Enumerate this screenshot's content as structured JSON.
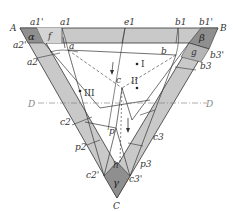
{
  "diagram": {
    "colors": {
      "band": "#c9c9c9",
      "corner": "#8f8f8f",
      "edge_shade": "#b5b5b5",
      "line": "#333333",
      "background": "#ffffff"
    },
    "vertices": {
      "A": "A",
      "B": "B",
      "C": "C"
    },
    "corner_regions": {
      "alpha": "α",
      "beta": "β",
      "gamma": "γ"
    },
    "two_phase_regions": {
      "f": "f",
      "g": "g",
      "h": "h"
    },
    "region_numbers": {
      "I": "I",
      "II": "II",
      "III": "III"
    },
    "points": {
      "a": "a",
      "b": "b",
      "c": "c",
      "p": "p"
    },
    "top_edge_labels": {
      "a1p": "a1'",
      "a1": "a1",
      "e1": "e1",
      "b1": "b1",
      "b1p": "b1'"
    },
    "left_edge_labels": {
      "a2p": "a2'",
      "a2": "a2",
      "c2": "c2",
      "p2": "p2",
      "c2p": "c2'"
    },
    "right_edge_labels": {
      "b3p": "b3'",
      "b3": "b3",
      "c3": "c3",
      "p3": "p3",
      "c3p": "c3'"
    },
    "section_line": {
      "left": "D",
      "right": "D"
    }
  }
}
